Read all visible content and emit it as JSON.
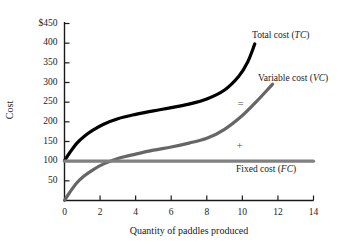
{
  "chart_data": {
    "type": "line",
    "title": "",
    "xlabel": "Quantity of paddles produced",
    "ylabel": "Cost",
    "xlim": [
      0,
      14
    ],
    "ylim": [
      0,
      450
    ],
    "grid": false,
    "legend_position": "inline-right",
    "x_ticks": [
      "0",
      "2",
      "4",
      "6",
      "8",
      "10",
      "12",
      "14"
    ],
    "x_tick_values": [
      0,
      2,
      4,
      6,
      8,
      10,
      12,
      14
    ],
    "y_ticks": [
      "50",
      "100",
      "150",
      "200",
      "250",
      "300",
      "350",
      "400",
      "$450"
    ],
    "y_tick_values": [
      50,
      100,
      150,
      200,
      250,
      300,
      350,
      400,
      450
    ],
    "series": [
      {
        "name": "Total cost (TC)",
        "label_main": "Total cost (",
        "label_abbr": "TC",
        "label_close": ")",
        "color": "#000000",
        "width": 3.2,
        "x": [
          0,
          0.3,
          0.7,
          1.1,
          1.6,
          2.2,
          3.0,
          4.0,
          5.0,
          6.0,
          7.0,
          8.0,
          9.0,
          9.8,
          10.3,
          10.7
        ],
        "y": [
          101,
          122,
          146,
          163,
          179,
          194,
          208,
          219,
          228,
          236,
          245,
          258,
          281,
          316,
          352,
          398
        ]
      },
      {
        "name": "Variable cost (VC)",
        "label_main": "Variable cost (",
        "label_abbr": "VC",
        "label_close": ")",
        "color": "#666666",
        "width": 3.2,
        "x": [
          0,
          0.3,
          0.7,
          1.1,
          1.6,
          2.2,
          3.0,
          4.0,
          5.0,
          6.0,
          7.0,
          8.0,
          9.0,
          10.0,
          10.8,
          11.4,
          11.7
        ],
        "y": [
          0,
          21,
          45,
          62,
          78,
          93,
          107,
          118,
          128,
          136,
          146,
          158,
          181,
          216,
          252,
          281,
          296
        ]
      },
      {
        "name": "Fixed cost (FC)",
        "label_main": "Fixed cost (",
        "label_abbr": "FC",
        "label_close": ")",
        "color": "#808080",
        "width": 3.2,
        "x": [
          0,
          14
        ],
        "y": [
          100,
          100
        ]
      }
    ],
    "annotations": [
      {
        "text": "=",
        "x": 9.9,
        "y": 247
      },
      {
        "text": "+",
        "x": 9.85,
        "y": 140
      }
    ]
  },
  "labels": {
    "total_cost_prefix": "Total cost (",
    "total_cost_abbr": "TC",
    "total_cost_suffix": ")",
    "variable_cost_prefix": "Variable cost (",
    "variable_cost_abbr": "VC",
    "variable_cost_suffix": ")",
    "fixed_cost_prefix": "Fixed cost (",
    "fixed_cost_abbr": "FC",
    "fixed_cost_suffix": ")",
    "equals_symbol": "=",
    "plus_symbol": "+"
  },
  "axes": {
    "x_title": "Quantity of paddles produced",
    "y_title": "Cost",
    "axis_color": "#1a1a1a"
  }
}
